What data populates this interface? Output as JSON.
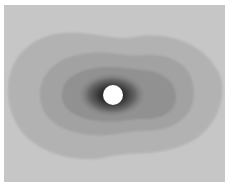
{
  "figure": {
    "colors": {
      "background": "#c8c8c8",
      "contour1": "#b4b4b4",
      "contour2": "#9e9e9e",
      "contour3": "#8a8a8a",
      "core_dark": "#202020",
      "disk": "#ffffff"
    }
  },
  "caption": {
    "text": ""
  }
}
